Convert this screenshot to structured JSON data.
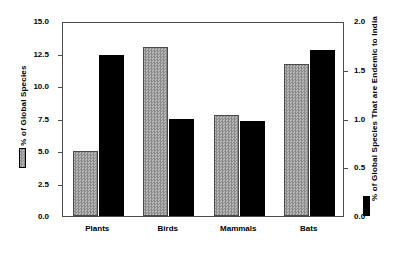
{
  "chart_data": {
    "type": "bar",
    "title": "",
    "xlabel": "",
    "categories": [
      "Plants",
      "Birds",
      "Mammals",
      "Bats"
    ],
    "series": [
      {
        "name": "% of Global Species",
        "axis": "left",
        "color": "#9d9d9d",
        "values": [
          5.0,
          13.0,
          7.8,
          11.7
        ]
      },
      {
        "name": "% of Global Species That are Endemic to India",
        "axis": "right",
        "color": "#000000",
        "values": [
          1.65,
          1.0,
          0.97,
          1.7
        ]
      }
    ],
    "left_axis": {
      "label": "% of Global Species",
      "ticks": [
        "0.0",
        "2.5",
        "5.0",
        "7.5",
        "10.0",
        "12.5",
        "15.0"
      ],
      "tick_values": [
        0.0,
        2.5,
        5.0,
        7.5,
        10.0,
        12.5,
        15.0
      ],
      "ylim": [
        0.0,
        15.0
      ]
    },
    "right_axis": {
      "label": "% of Global Species That are Endemic to India",
      "ticks": [
        "0.0",
        "0.5",
        "1.0",
        "1.5",
        "2.0"
      ],
      "tick_values": [
        0.0,
        0.5,
        1.0,
        1.5,
        2.0
      ],
      "ylim": [
        0.0,
        2.0
      ]
    },
    "grid": false,
    "legend_position": "outside-left-and-right"
  },
  "legend": {
    "left_entry_label": "% of Global Species",
    "right_entry_label": "% of Global Species That are Endemic to India",
    "left_swatch": "gray-hatched-swatch",
    "right_swatch": "black-swatch"
  }
}
